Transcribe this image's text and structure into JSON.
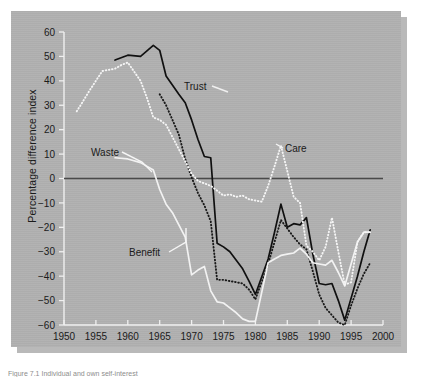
{
  "figure": {
    "panel_bg": "#b0b0b0",
    "shadow": "#b9b9b9",
    "caption": "Figure 7.1   Individual and own self-interest"
  },
  "axis": {
    "ylabel": "Percentage difference index",
    "y_ticks": [
      "60",
      "50",
      "40",
      "30",
      "20",
      "10",
      "0",
      "−10",
      "−20",
      "−30",
      "−40",
      "−50",
      "−60"
    ],
    "x_ticks": [
      "1950",
      "1955",
      "1960",
      "1965",
      "1970",
      "1975",
      "1980",
      "1985",
      "1990",
      "1995",
      "2000"
    ]
  },
  "labels": {
    "trust": "Trust",
    "waste": "Waste",
    "benefit": "Benefit",
    "care": "Care"
  },
  "chart_data": {
    "type": "line",
    "title": "",
    "xlabel": "",
    "ylabel": "Percentage difference index",
    "xlim": [
      1950,
      2000
    ],
    "ylim": [
      -60,
      60
    ],
    "x_tick_values": [
      1950,
      1955,
      1960,
      1965,
      1970,
      1975,
      1980,
      1985,
      1990,
      1995,
      2000
    ],
    "y_tick_values": [
      60,
      50,
      40,
      30,
      20,
      10,
      0,
      -10,
      -20,
      -30,
      -40,
      -50,
      -60
    ],
    "grid": false,
    "legend": "inline-annotations",
    "zero_line": true,
    "series": [
      {
        "name": "Trust",
        "style": "solid",
        "color": "#101010",
        "points": [
          [
            1958,
            48.5
          ],
          [
            1960,
            50.5
          ],
          [
            1962,
            50.0
          ],
          [
            1964,
            54.5
          ],
          [
            1965,
            52.5
          ],
          [
            1966,
            42.0
          ],
          [
            1968,
            34.5
          ],
          [
            1969,
            31.0
          ],
          [
            1970,
            24.0
          ],
          [
            1971,
            16.0
          ],
          [
            1972,
            9.0
          ],
          [
            1973,
            8.5
          ],
          [
            1974,
            -26.5
          ],
          [
            1975,
            -28.0
          ],
          [
            1976,
            -30.0
          ],
          [
            1977,
            -33.5
          ],
          [
            1978,
            -37.0
          ],
          [
            1979,
            -42.0
          ],
          [
            1980,
            -47.5
          ],
          [
            1982,
            -33.0
          ],
          [
            1983,
            -22.0
          ],
          [
            1984,
            -10.5
          ],
          [
            1985,
            -20.0
          ],
          [
            1986,
            -18.5
          ],
          [
            1987,
            -19.0
          ],
          [
            1988,
            -16.0
          ],
          [
            1989,
            -31.0
          ],
          [
            1990,
            -43.0
          ],
          [
            1991,
            -43.5
          ],
          [
            1992,
            -43.0
          ],
          [
            1993,
            -50.0
          ],
          [
            1994,
            -58.0
          ],
          [
            1996,
            -40.0
          ],
          [
            1997,
            -30.0
          ],
          [
            1998,
            -21.0
          ]
        ]
      },
      {
        "name": "Benefit",
        "style": "dotted",
        "color": "#1a1a1a",
        "points": [
          [
            1965,
            34.5
          ],
          [
            1966,
            30.0
          ],
          [
            1967,
            24.0
          ],
          [
            1968,
            18.0
          ],
          [
            1969,
            8.0
          ],
          [
            1970,
            0.5
          ],
          [
            1971,
            -6.0
          ],
          [
            1972,
            -11.0
          ],
          [
            1973,
            -17.5
          ],
          [
            1974,
            -41.5
          ],
          [
            1975,
            -41.5
          ],
          [
            1976,
            -42.0
          ],
          [
            1977,
            -42.5
          ],
          [
            1978,
            -43.0
          ],
          [
            1979,
            -45.5
          ],
          [
            1980,
            -49.5
          ],
          [
            1982,
            -35.0
          ],
          [
            1983,
            -26.0
          ],
          [
            1984,
            -17.0
          ],
          [
            1985,
            -20.5
          ],
          [
            1986,
            -24.0
          ],
          [
            1987,
            -27.0
          ],
          [
            1988,
            -29.0
          ],
          [
            1989,
            -38.0
          ],
          [
            1990,
            -47.5
          ],
          [
            1991,
            -53.0
          ],
          [
            1992,
            -56.0
          ],
          [
            1993,
            -59.0
          ],
          [
            1994,
            -60.0
          ],
          [
            1995,
            -52.0
          ],
          [
            1996,
            -45.0
          ],
          [
            1997,
            -39.0
          ],
          [
            1998,
            -34.5
          ]
        ]
      },
      {
        "name": "Waste",
        "style": "solid",
        "color": "#f2f2f2",
        "points": [
          [
            1958,
            8.5
          ],
          [
            1960,
            8.0
          ],
          [
            1962,
            6.5
          ],
          [
            1964,
            3.5
          ],
          [
            1965,
            -4.5
          ],
          [
            1966,
            -10.5
          ],
          [
            1967,
            -14.0
          ],
          [
            1968,
            -19.0
          ],
          [
            1969,
            -24.0
          ],
          [
            1970,
            -39.5
          ],
          [
            1971,
            -37.5
          ],
          [
            1972,
            -36.0
          ],
          [
            1973,
            -46.0
          ],
          [
            1974,
            -50.5
          ],
          [
            1975,
            -51.0
          ],
          [
            1976,
            -53.0
          ],
          [
            1977,
            -55.0
          ],
          [
            1978,
            -57.5
          ],
          [
            1979,
            -58.5
          ],
          [
            1980,
            -58.5
          ],
          [
            1982,
            -34.5
          ],
          [
            1983,
            -33.0
          ],
          [
            1984,
            -31.5
          ],
          [
            1985,
            -31.0
          ],
          [
            1986,
            -30.5
          ],
          [
            1987,
            -28.5
          ],
          [
            1988,
            -31.0
          ],
          [
            1989,
            -34.5
          ],
          [
            1990,
            -35.0
          ],
          [
            1991,
            -35.5
          ],
          [
            1992,
            -33.5
          ],
          [
            1993,
            -38.5
          ],
          [
            1994,
            -44.0
          ],
          [
            1995,
            -35.0
          ],
          [
            1996,
            -26.0
          ],
          [
            1997,
            -22.0
          ],
          [
            1998,
            -22.0
          ]
        ]
      },
      {
        "name": "Care",
        "style": "dotted",
        "color": "#f5f5f5",
        "points": [
          [
            1952,
            27.5
          ],
          [
            1954,
            36.0
          ],
          [
            1956,
            44.0
          ],
          [
            1957,
            44.5
          ],
          [
            1958,
            45.0
          ],
          [
            1959,
            46.5
          ],
          [
            1960,
            47.5
          ],
          [
            1962,
            40.0
          ],
          [
            1963,
            33.0
          ],
          [
            1964,
            25.0
          ],
          [
            1965,
            24.0
          ],
          [
            1966,
            22.0
          ],
          [
            1967,
            17.0
          ],
          [
            1968,
            12.0
          ],
          [
            1969,
            7.0
          ],
          [
            1970,
            2.0
          ],
          [
            1971,
            -1.0
          ],
          [
            1972,
            -2.0
          ],
          [
            1973,
            -3.0
          ],
          [
            1974,
            -5.0
          ],
          [
            1975,
            -7.0
          ],
          [
            1976,
            -6.5
          ],
          [
            1977,
            -7.5
          ],
          [
            1978,
            -7.0
          ],
          [
            1979,
            -8.5
          ],
          [
            1980,
            -9.0
          ],
          [
            1981,
            -9.5
          ],
          [
            1982,
            -3.0
          ],
          [
            1983,
            5.0
          ],
          [
            1984,
            13.5
          ],
          [
            1985,
            3.0
          ],
          [
            1986,
            -7.5
          ],
          [
            1987,
            -10.0
          ],
          [
            1988,
            -27.5
          ],
          [
            1989,
            -30.0
          ],
          [
            1990,
            -33.5
          ],
          [
            1991,
            -28.0
          ],
          [
            1992,
            -16.0
          ],
          [
            1993,
            -30.0
          ],
          [
            1994,
            -43.5
          ],
          [
            1995,
            -42.5
          ],
          [
            1996,
            -26.0
          ],
          [
            1997,
            -22.0
          ],
          [
            1998,
            -22.0
          ]
        ]
      }
    ]
  }
}
